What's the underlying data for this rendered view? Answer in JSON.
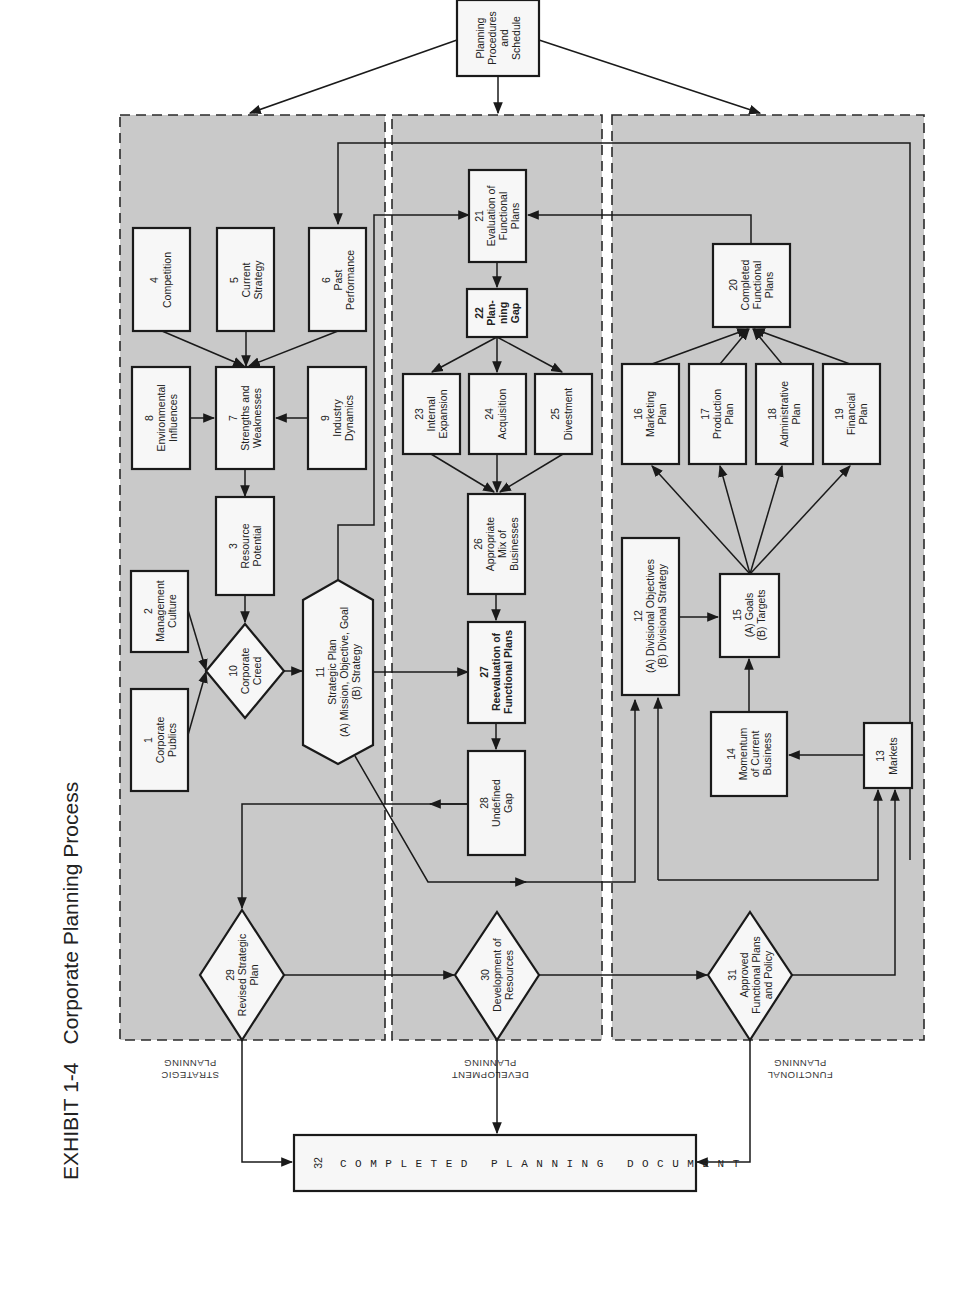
{
  "title": {
    "exhibit": "EXHIBIT 1-4",
    "name": "Corporate Planning Process"
  },
  "lanes": [
    {
      "id": "strategic",
      "label_line1": "STRATEGIC",
      "label_line2": "PLANNING"
    },
    {
      "id": "development",
      "label_line1": "DEVELOPMENT",
      "label_line2": "PLANNING"
    },
    {
      "id": "functional",
      "label_line1": "FUNCTIONAL",
      "label_line2": "PLANNING"
    }
  ],
  "top_node": {
    "lines": [
      "Planning",
      "Procedures",
      "and",
      "Schedule"
    ]
  },
  "nodes": {
    "n1": {
      "num": "1",
      "lines": [
        "Corporate",
        "Publics"
      ]
    },
    "n2": {
      "num": "2",
      "lines": [
        "Management",
        "Culture"
      ]
    },
    "n3": {
      "num": "3",
      "lines": [
        "Resource",
        "Potential"
      ]
    },
    "n4": {
      "num": "4",
      "lines": [
        "Competition"
      ]
    },
    "n5": {
      "num": "5",
      "lines": [
        "Current",
        "Strategy"
      ]
    },
    "n6": {
      "num": "6",
      "lines": [
        "Past",
        "Performance"
      ]
    },
    "n7": {
      "num": "7",
      "lines": [
        "Strengths and",
        "Weaknesses"
      ]
    },
    "n8": {
      "num": "8",
      "lines": [
        "Environmental",
        "Influences"
      ]
    },
    "n9": {
      "num": "9",
      "lines": [
        "Industry",
        "Dynamics"
      ]
    },
    "n10": {
      "num": "10",
      "lines": [
        "Corporate",
        "Creed"
      ]
    },
    "n11": {
      "num": "11",
      "lines": [
        "Strategic Plan",
        "(A) Mission, Objective, Goal",
        "(B) Strategy"
      ]
    },
    "n12": {
      "num": "12",
      "lines": [
        "(A) Divisional Objectives",
        "(B) Divisional Strategy"
      ]
    },
    "n13": {
      "num": "13",
      "lines": [
        "Markets"
      ]
    },
    "n14": {
      "num": "14",
      "lines": [
        "Momentum",
        "of Current",
        "Business"
      ]
    },
    "n15": {
      "num": "15",
      "lines": [
        "(A) Goals",
        "(B) Targets"
      ]
    },
    "n16": {
      "num": "16",
      "lines": [
        "Marketing",
        "Plan"
      ]
    },
    "n17": {
      "num": "17",
      "lines": [
        "Production",
        "Plan"
      ]
    },
    "n18": {
      "num": "18",
      "lines": [
        "Administrative",
        "Plan"
      ]
    },
    "n19": {
      "num": "19",
      "lines": [
        "Financial",
        "Plan"
      ]
    },
    "n20": {
      "num": "20",
      "lines": [
        "Completed",
        "Functional",
        "Plans"
      ]
    },
    "n21": {
      "num": "21",
      "lines": [
        "Evaluation of",
        "Functional",
        "Plans"
      ]
    },
    "n22": {
      "num": "22",
      "lines": [
        "Plan-",
        "ning",
        "Gap"
      ]
    },
    "n23": {
      "num": "23",
      "lines": [
        "Internal",
        "Expansion"
      ]
    },
    "n24": {
      "num": "24",
      "lines": [
        "Acquisition"
      ]
    },
    "n25": {
      "num": "25",
      "lines": [
        "Divestment"
      ]
    },
    "n26": {
      "num": "26",
      "lines": [
        "Appropriate",
        "Mix of",
        "Businesses"
      ]
    },
    "n27": {
      "num": "27",
      "lines": [
        "Reevaluation of",
        "Functional Plans"
      ]
    },
    "n28": {
      "num": "28",
      "lines": [
        "Undefined",
        "Gap"
      ]
    },
    "n29": {
      "num": "29",
      "lines": [
        "Revised Strategic",
        "Plan"
      ]
    },
    "n30": {
      "num": "30",
      "lines": [
        "Development of",
        "Resources"
      ]
    },
    "n31": {
      "num": "31",
      "lines": [
        "Approved",
        "Functional Plans",
        "and Policy"
      ]
    },
    "n32": {
      "num": "32",
      "lines": [
        "COMPLETED PLANNING DOCUMENT"
      ]
    }
  }
}
